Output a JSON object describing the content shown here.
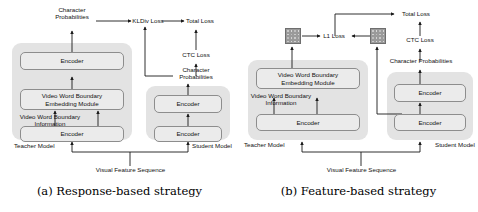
{
  "figure": {
    "panels": [
      {
        "id": "a",
        "caption": "(a) Response-based strategy",
        "teacher_group_label": "Teacher Model",
        "student_group_label": "Student Model",
        "shared_input_label": "Visual Feature Sequence",
        "teacher_nodes": [
          {
            "name": "encoder-top",
            "label": "Encoder"
          },
          {
            "name": "vwb-embedding-module",
            "label": "Video Word Boundary\nEmbedding Module"
          },
          {
            "name": "encoder-bottom",
            "label": "Encoder"
          }
        ],
        "teacher_side_label": "Video Word Boundary\nInformation",
        "teacher_output_label": "Character\nProbabilities",
        "student_nodes": [
          {
            "name": "encoder-top",
            "label": "Encoder"
          },
          {
            "name": "encoder-bottom",
            "label": "Encoder"
          }
        ],
        "student_output_label": "Character\nProbabilities",
        "losses": [
          {
            "name": "kldiv-loss",
            "label": "KLDiv Loss"
          },
          {
            "name": "ctc-loss",
            "label": "CTC Loss"
          },
          {
            "name": "total-loss",
            "label": "Total Loss"
          }
        ]
      },
      {
        "id": "b",
        "caption": "(b) Feature-based strategy",
        "teacher_group_label": "Teacher Model",
        "student_group_label": "Student Model",
        "shared_input_label": "Visual Feature Sequence",
        "teacher_nodes": [
          {
            "name": "vwb-embedding-module",
            "label": "Video Word Boundary\nEmbedding Module"
          },
          {
            "name": "encoder-bottom",
            "label": "Encoder"
          }
        ],
        "teacher_side_label": "Video Word Boundary\nInformation",
        "student_nodes": [
          {
            "name": "encoder-top",
            "label": "Encoder"
          },
          {
            "name": "encoder-bottom",
            "label": "Encoder"
          }
        ],
        "student_output_label": "Character Probabilities",
        "feature_maps": [
          {
            "name": "teacher-feature-map"
          },
          {
            "name": "student-feature-map"
          }
        ],
        "losses": [
          {
            "name": "l1-loss",
            "label": "L1 Loss"
          },
          {
            "name": "ctc-loss",
            "label": "CTC Loss"
          },
          {
            "name": "total-loss",
            "label": "Total Loss"
          }
        ]
      }
    ]
  },
  "colors": {
    "group_fill": "#e3e3e3",
    "node_fill": "#ebebeb",
    "node_stroke": "#8d8d8d",
    "wire": "#1a1a1a",
    "background": "#ffffff"
  }
}
